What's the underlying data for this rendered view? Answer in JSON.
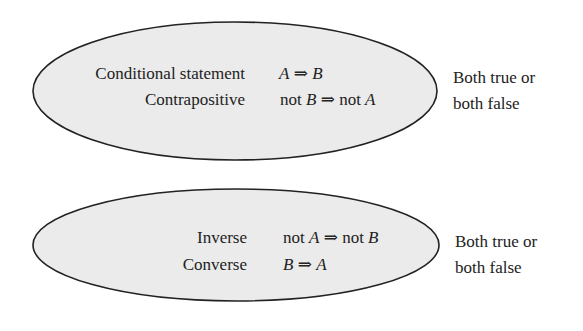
{
  "colors": {
    "ellipse_fill": "#ebebeb",
    "ellipse_stroke": "#222222",
    "text": "#222222"
  },
  "groups": [
    {
      "rows": [
        {
          "label": "Conditional statement",
          "math": {
            "pre": "",
            "a": "A",
            "arrow": "⇒",
            "mid": "",
            "b": "B"
          }
        },
        {
          "label": "Contrapositive",
          "math": {
            "pre": "not ",
            "a": "B",
            "arrow": "⇒",
            "mid": "not ",
            "b": "A"
          }
        }
      ],
      "relation": [
        "Both true or",
        "both false"
      ]
    },
    {
      "rows": [
        {
          "label": "Inverse",
          "math": {
            "pre": "not ",
            "a": "A",
            "arrow": "⇒",
            "mid": "not ",
            "b": "B"
          }
        },
        {
          "label": "Converse",
          "math": {
            "pre": "",
            "a": "B",
            "arrow": "⇒",
            "mid": "",
            "b": "A"
          }
        }
      ],
      "relation": [
        "Both true or",
        "both false"
      ]
    }
  ]
}
